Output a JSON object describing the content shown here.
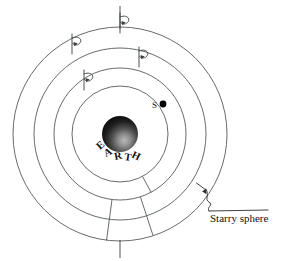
{
  "figure": {
    "name": "geocentric-celestial-spheres-diagram",
    "background_color": "#ffffff",
    "line_color": "#555a5e",
    "ink_color": "#111111"
  },
  "center": {
    "cx": 120,
    "cy": 134
  },
  "earth": {
    "label": "EARTH",
    "label_letters": [
      "E",
      "A",
      "R",
      "T",
      "H"
    ],
    "radius": 18,
    "shading": "sphere shaded dark upper-left, lighter lower-right"
  },
  "star": {
    "label": "S",
    "label_x": 152,
    "label_y": 107,
    "dot_x": 163,
    "dot_y": 104,
    "dot_radius": 3.2,
    "color": "#000000"
  },
  "rings": [
    {
      "name": "ring-4-outer",
      "radius": 107,
      "label": "Starry sphere"
    },
    {
      "name": "ring-3",
      "radius": 86,
      "label": ""
    },
    {
      "name": "ring-2",
      "radius": 66,
      "label": ""
    },
    {
      "name": "ring-1-inner",
      "radius": 48,
      "label": ""
    }
  ],
  "rotation_markers": [
    {
      "name": "rotation-marker-outer",
      "ring_radius": 107,
      "angle_deg": -90,
      "symbol": "rotation-arrow"
    },
    {
      "name": "rotation-marker-ring3",
      "ring_radius": 86,
      "angle_deg": -118,
      "symbol": "rotation-arrow"
    },
    {
      "name": "rotation-marker-ring2",
      "ring_radius": 66,
      "angle_deg": -73,
      "symbol": "rotation-arrow"
    },
    {
      "name": "rotation-marker-ring1",
      "ring_radius": 48,
      "angle_deg": -125,
      "symbol": "rotation-arrow"
    }
  ],
  "spokes": [
    {
      "name": "spoke-inner",
      "angle_deg": 62
    },
    {
      "name": "spoke-middle",
      "angle_deg": 97
    },
    {
      "name": "spoke-outer",
      "angle_deg": 72
    }
  ],
  "axis_ticks": [
    {
      "name": "axis-tick-top",
      "x": 120,
      "y1": 6,
      "y2": 27
    },
    {
      "name": "axis-tick-bottom",
      "x": 120,
      "y1": 240,
      "y2": 258
    }
  ],
  "annotation": {
    "name": "starry-sphere-callout",
    "text": "Starry sphere",
    "text_x": 210,
    "text_y": 218,
    "leader_from": {
      "x": 207,
      "y": 190
    },
    "leader_to": {
      "x": 208,
      "y": 212
    }
  }
}
